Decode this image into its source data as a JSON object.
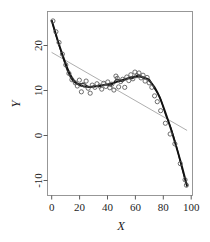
{
  "chart_data": {
    "type": "scatter",
    "title": "",
    "xlabel": "X",
    "ylabel": "Y",
    "xlim": [
      -3,
      104
    ],
    "ylim": [
      -12.5,
      28.5
    ],
    "xticks": [
      0,
      20,
      40,
      60,
      80,
      100
    ],
    "yticks": [
      20,
      10,
      0,
      -10
    ],
    "xtick_labels": [
      "0",
      "20",
      "40",
      "60",
      "80",
      "100"
    ],
    "ytick_labels": [
      "20",
      "10",
      "0",
      "-10"
    ],
    "grid": false,
    "legend": "none",
    "marker": "open-circle",
    "points": [
      {
        "x": 1.0,
        "y": 26.4
      },
      {
        "x": 3.2,
        "y": 24.0
      },
      {
        "x": 5.5,
        "y": 21.6
      },
      {
        "x": 8.0,
        "y": 19.0
      },
      {
        "x": 10.5,
        "y": 16.6
      },
      {
        "x": 12.8,
        "y": 14.7
      },
      {
        "x": 15.0,
        "y": 13.3
      },
      {
        "x": 17.5,
        "y": 12.6
      },
      {
        "x": 19.0,
        "y": 11.9
      },
      {
        "x": 20.5,
        "y": 13.2
      },
      {
        "x": 22.0,
        "y": 10.6
      },
      {
        "x": 23.5,
        "y": 12.2
      },
      {
        "x": 25.5,
        "y": 13.0
      },
      {
        "x": 27.0,
        "y": 11.4
      },
      {
        "x": 28.5,
        "y": 10.3
      },
      {
        "x": 30.0,
        "y": 12.1
      },
      {
        "x": 32.0,
        "y": 11.6
      },
      {
        "x": 33.5,
        "y": 12.4
      },
      {
        "x": 35.5,
        "y": 11.9
      },
      {
        "x": 37.0,
        "y": 11.2
      },
      {
        "x": 38.5,
        "y": 12.5
      },
      {
        "x": 40.0,
        "y": 11.8
      },
      {
        "x": 41.5,
        "y": 12.8
      },
      {
        "x": 43.0,
        "y": 11.5
      },
      {
        "x": 44.5,
        "y": 12.3
      },
      {
        "x": 46.0,
        "y": 11.0
      },
      {
        "x": 47.5,
        "y": 14.1
      },
      {
        "x": 48.5,
        "y": 13.6
      },
      {
        "x": 49.5,
        "y": 11.7
      },
      {
        "x": 51.0,
        "y": 12.9
      },
      {
        "x": 52.5,
        "y": 13.4
      },
      {
        "x": 54.0,
        "y": 11.6
      },
      {
        "x": 55.5,
        "y": 13.9
      },
      {
        "x": 57.0,
        "y": 13.1
      },
      {
        "x": 58.5,
        "y": 14.4
      },
      {
        "x": 60.0,
        "y": 13.5
      },
      {
        "x": 61.5,
        "y": 15.0
      },
      {
        "x": 63.0,
        "y": 14.2
      },
      {
        "x": 64.5,
        "y": 14.8
      },
      {
        "x": 66.0,
        "y": 13.7
      },
      {
        "x": 67.5,
        "y": 14.3
      },
      {
        "x": 69.0,
        "y": 13.0
      },
      {
        "x": 70.5,
        "y": 13.8
      },
      {
        "x": 72.0,
        "y": 12.6
      },
      {
        "x": 74.0,
        "y": 11.6
      },
      {
        "x": 76.0,
        "y": 9.7
      },
      {
        "x": 78.0,
        "y": 8.4
      },
      {
        "x": 80.5,
        "y": 6.4
      },
      {
        "x": 84.0,
        "y": 3.6
      },
      {
        "x": 87.5,
        "y": 1.2
      },
      {
        "x": 91.0,
        "y": -1.0
      },
      {
        "x": 95.0,
        "y": -5.4
      },
      {
        "x": 98.5,
        "y": -9.0
      },
      {
        "x": 99.5,
        "y": -10.2
      }
    ],
    "series": [
      {
        "name": "smooth-fit",
        "type": "line",
        "style": "thick-black",
        "x": [
          0,
          4,
          8,
          12,
          16,
          20,
          24,
          28,
          32,
          36,
          40,
          44,
          48,
          52,
          56,
          60,
          64,
          68,
          72,
          76,
          80,
          84,
          88,
          92,
          96,
          100
        ],
        "y": [
          26.6,
          22.6,
          18.9,
          15.6,
          13.3,
          12.2,
          11.8,
          11.7,
          11.8,
          12.0,
          12.2,
          12.4,
          12.8,
          13.2,
          13.6,
          13.9,
          14.0,
          13.8,
          13.1,
          11.6,
          9.2,
          6.0,
          2.4,
          -1.6,
          -5.8,
          -10.4
        ]
      },
      {
        "name": "wiggly-fit",
        "type": "line",
        "style": "thin-black",
        "x": [
          0,
          4,
          8,
          12,
          16,
          20,
          24,
          28,
          32,
          36,
          40,
          44,
          48,
          52,
          56,
          60,
          64,
          68,
          72,
          76,
          80,
          84,
          88,
          92,
          96,
          100
        ],
        "y": [
          26.6,
          22.4,
          18.6,
          15.0,
          12.9,
          12.4,
          12.4,
          11.6,
          12.0,
          11.8,
          12.2,
          12.0,
          13.4,
          12.9,
          13.5,
          13.6,
          14.4,
          13.6,
          13.4,
          11.3,
          9.4,
          5.6,
          2.6,
          -1.4,
          -6.2,
          -10.6
        ]
      },
      {
        "name": "linear-fit",
        "type": "line",
        "style": "gray-straight",
        "x": [
          0,
          100
        ],
        "y": [
          19.4,
          2.0
        ]
      }
    ]
  },
  "axes": {
    "x_title": "X",
    "y_title": "Y"
  }
}
